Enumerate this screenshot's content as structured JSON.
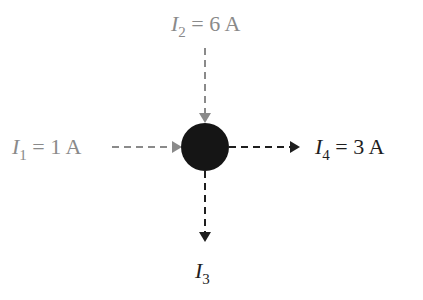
{
  "diagram": {
    "type": "kirchhoff-junction",
    "node": {
      "cx": 205,
      "cy": 147,
      "r": 24,
      "color": "#151515"
    },
    "currents": [
      {
        "id": "I1",
        "symbol": "I",
        "subscript": "1",
        "value_text": "= 1 A",
        "direction": "in",
        "from": "left",
        "color": "#8a8a8a"
      },
      {
        "id": "I2",
        "symbol": "I",
        "subscript": "2",
        "value_text": "= 6 A",
        "direction": "in",
        "from": "top",
        "color": "#8a8a8a"
      },
      {
        "id": "I3",
        "symbol": "I",
        "subscript": "3",
        "value_text": "",
        "direction": "out",
        "to": "bottom",
        "color": "#1e1e1e"
      },
      {
        "id": "I4",
        "symbol": "I",
        "subscript": "4",
        "value_text": "= 3 A",
        "direction": "out",
        "to": "right",
        "color": "#1e1e1e"
      }
    ]
  }
}
